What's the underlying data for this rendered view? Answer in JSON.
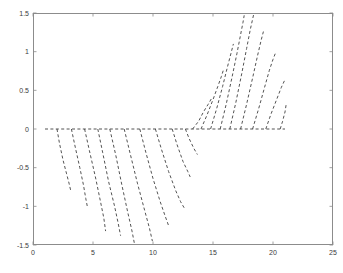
{
  "chart_data": {
    "type": "line",
    "title": "",
    "xlabel": "",
    "ylabel": "",
    "xlim": [
      0,
      25
    ],
    "ylim": [
      -1.5,
      1.5
    ],
    "grid": false,
    "legend": null,
    "linestyle": "dashed",
    "color": "#404040",
    "xticks": [
      0,
      5,
      10,
      15,
      20,
      25
    ],
    "xtick_labels": [
      "0",
      "5",
      "10",
      "15",
      "20",
      "25"
    ],
    "yticks": [
      -1.5,
      -1,
      -0.5,
      0,
      0.5,
      1,
      1.5
    ],
    "ytick_labels": [
      "-1.5",
      "-1",
      "-0.5",
      "0",
      "0.5",
      "1",
      "1.5"
    ],
    "series": [
      {
        "name": "zero-baseline",
        "points": [
          [
            1.0,
            0.0
          ],
          [
            21.0,
            0.0
          ]
        ]
      },
      {
        "name": "down-1",
        "points": [
          [
            2.0,
            0.0
          ],
          [
            2.2,
            -0.18
          ],
          [
            2.5,
            -0.4
          ],
          [
            2.8,
            -0.58
          ],
          [
            3.0,
            -0.7
          ],
          [
            3.15,
            -0.8
          ]
        ]
      },
      {
        "name": "down-2",
        "points": [
          [
            3.2,
            0.0
          ],
          [
            3.5,
            -0.22
          ],
          [
            3.9,
            -0.5
          ],
          [
            4.2,
            -0.72
          ],
          [
            4.4,
            -0.9
          ],
          [
            4.55,
            -1.02
          ]
        ]
      },
      {
        "name": "down-3",
        "points": [
          [
            4.3,
            0.0
          ],
          [
            4.7,
            -0.28
          ],
          [
            5.2,
            -0.62
          ],
          [
            5.6,
            -0.92
          ],
          [
            5.9,
            -1.15
          ],
          [
            6.05,
            -1.32
          ]
        ]
      },
      {
        "name": "down-4",
        "points": [
          [
            5.4,
            0.0
          ],
          [
            5.8,
            -0.3
          ],
          [
            6.3,
            -0.68
          ],
          [
            6.8,
            -1.0
          ],
          [
            7.1,
            -1.22
          ],
          [
            7.3,
            -1.38
          ]
        ]
      },
      {
        "name": "down-5",
        "points": [
          [
            6.4,
            0.0
          ],
          [
            6.9,
            -0.34
          ],
          [
            7.4,
            -0.72
          ],
          [
            7.9,
            -1.08
          ],
          [
            8.25,
            -1.32
          ],
          [
            8.45,
            -1.48
          ]
        ]
      },
      {
        "name": "down-6",
        "points": [
          [
            7.6,
            0.0
          ],
          [
            8.1,
            -0.32
          ],
          [
            8.7,
            -0.7
          ],
          [
            9.3,
            -1.05
          ],
          [
            9.7,
            -1.28
          ],
          [
            9.95,
            -1.45
          ]
        ]
      },
      {
        "name": "down-7",
        "points": [
          [
            8.9,
            0.0
          ],
          [
            9.4,
            -0.3
          ],
          [
            10.0,
            -0.64
          ],
          [
            10.6,
            -0.94
          ],
          [
            11.0,
            -1.12
          ],
          [
            11.3,
            -1.25
          ]
        ]
      },
      {
        "name": "down-8",
        "points": [
          [
            10.2,
            0.0
          ],
          [
            10.7,
            -0.26
          ],
          [
            11.3,
            -0.55
          ],
          [
            11.9,
            -0.8
          ],
          [
            12.3,
            -0.94
          ],
          [
            12.6,
            -1.02
          ]
        ]
      },
      {
        "name": "down-9",
        "points": [
          [
            11.6,
            0.0
          ],
          [
            12.0,
            -0.2
          ],
          [
            12.5,
            -0.42
          ],
          [
            12.9,
            -0.55
          ],
          [
            13.1,
            -0.62
          ]
        ]
      },
      {
        "name": "down-10",
        "points": [
          [
            12.7,
            0.0
          ],
          [
            13.0,
            -0.12
          ],
          [
            13.4,
            -0.25
          ],
          [
            13.7,
            -0.33
          ]
        ]
      },
      {
        "name": "up-1",
        "points": [
          [
            13.3,
            0.0
          ],
          [
            13.8,
            0.1
          ],
          [
            14.2,
            0.22
          ],
          [
            14.6,
            0.32
          ],
          [
            14.9,
            0.4
          ]
        ]
      },
      {
        "name": "up-2",
        "points": [
          [
            14.0,
            0.0
          ],
          [
            14.5,
            0.18
          ],
          [
            15.0,
            0.38
          ],
          [
            15.4,
            0.55
          ],
          [
            15.7,
            0.68
          ],
          [
            15.9,
            0.78
          ]
        ]
      },
      {
        "name": "up-3",
        "points": [
          [
            14.8,
            0.0
          ],
          [
            15.3,
            0.26
          ],
          [
            15.8,
            0.55
          ],
          [
            16.2,
            0.8
          ],
          [
            16.5,
            0.98
          ],
          [
            16.7,
            1.1
          ]
        ]
      },
      {
        "name": "up-4",
        "points": [
          [
            15.6,
            0.0
          ],
          [
            16.1,
            0.32
          ],
          [
            16.6,
            0.68
          ],
          [
            17.0,
            0.98
          ],
          [
            17.3,
            1.22
          ],
          [
            17.5,
            1.38
          ],
          [
            17.6,
            1.47
          ]
        ]
      },
      {
        "name": "up-5",
        "points": [
          [
            16.4,
            0.0
          ],
          [
            16.9,
            0.34
          ],
          [
            17.4,
            0.72
          ],
          [
            17.8,
            1.04
          ],
          [
            18.1,
            1.28
          ],
          [
            18.3,
            1.42
          ],
          [
            18.4,
            1.49
          ]
        ]
      },
      {
        "name": "up-6",
        "points": [
          [
            17.3,
            0.0
          ],
          [
            17.8,
            0.32
          ],
          [
            18.3,
            0.66
          ],
          [
            18.7,
            0.94
          ],
          [
            19.0,
            1.14
          ],
          [
            19.2,
            1.26
          ]
        ]
      },
      {
        "name": "up-7",
        "points": [
          [
            18.3,
            0.0
          ],
          [
            18.8,
            0.26
          ],
          [
            19.3,
            0.54
          ],
          [
            19.7,
            0.76
          ],
          [
            20.0,
            0.9
          ],
          [
            20.2,
            0.98
          ]
        ]
      },
      {
        "name": "up-8",
        "points": [
          [
            19.4,
            0.0
          ],
          [
            19.8,
            0.18
          ],
          [
            20.3,
            0.38
          ],
          [
            20.7,
            0.54
          ],
          [
            21.0,
            0.64
          ]
        ]
      },
      {
        "name": "up-9",
        "points": [
          [
            20.6,
            0.0
          ],
          [
            20.8,
            0.1
          ],
          [
            21.0,
            0.22
          ],
          [
            21.1,
            0.32
          ]
        ]
      }
    ]
  }
}
